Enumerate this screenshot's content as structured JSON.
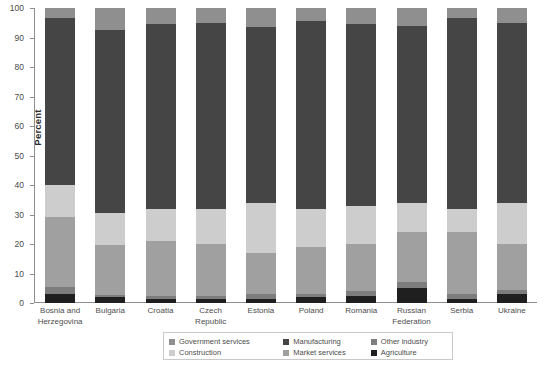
{
  "chart_data": {
    "type": "bar",
    "stacked": true,
    "title": "",
    "xlabel": "",
    "ylabel": "Percent",
    "ylim": [
      0,
      100
    ],
    "yticks": [
      0,
      10,
      20,
      30,
      40,
      50,
      60,
      70,
      80,
      90,
      100
    ],
    "grid": false,
    "legend_position": "bottom",
    "categories": [
      "Bosnia and Herzegovina",
      "Bulgaria",
      "Croatia",
      "Czech Republic",
      "Estonia",
      "Poland",
      "Romania",
      "Russian Federation",
      "Serbia",
      "Ukraine"
    ],
    "series": [
      {
        "name": "Agriculture",
        "color": "#1f1f1f",
        "values": [
          3.0,
          2.0,
          1.5,
          1.5,
          1.5,
          2.0,
          2.5,
          5.0,
          1.5,
          3.0
        ]
      },
      {
        "name": "Other industry",
        "color": "#7d7d7d",
        "values": [
          2.5,
          0.8,
          1.0,
          1.0,
          1.5,
          1.0,
          1.5,
          2.0,
          1.5,
          1.5
        ]
      },
      {
        "name": "Market services",
        "color": "#a0a0a0",
        "values": [
          23.5,
          16.7,
          18.5,
          17.5,
          14.0,
          16.0,
          16.0,
          17.0,
          21.0,
          15.5
        ]
      },
      {
        "name": "Construction",
        "color": "#cdcdcd",
        "values": [
          11.0,
          11.0,
          11.0,
          12.0,
          17.0,
          13.0,
          13.0,
          10.0,
          8.0,
          14.0
        ]
      },
      {
        "name": "Manufacturing",
        "color": "#454545",
        "values": [
          56.5,
          62.0,
          62.5,
          63.0,
          59.5,
          63.5,
          61.5,
          60.0,
          64.5,
          61.0
        ]
      },
      {
        "name": "Government services",
        "color": "#8f8f8f",
        "values": [
          3.5,
          7.5,
          5.5,
          5.0,
          6.5,
          4.5,
          5.5,
          6.0,
          3.5,
          5.0
        ]
      }
    ]
  },
  "legend": {
    "items": [
      {
        "label": "Government services",
        "color": "#8f8f8f"
      },
      {
        "label": "Construction",
        "color": "#cdcdcd"
      },
      {
        "label": "Manufacturing",
        "color": "#454545"
      },
      {
        "label": "Market services",
        "color": "#a0a0a0"
      },
      {
        "label": "Other industry",
        "color": "#7d7d7d"
      },
      {
        "label": "Agriculture",
        "color": "#1f1f1f"
      }
    ]
  }
}
